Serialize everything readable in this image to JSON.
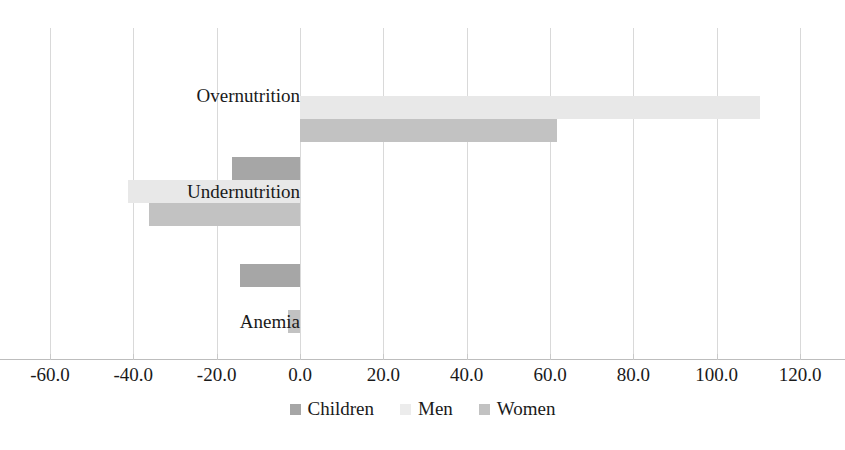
{
  "chart_data": {
    "type": "bar",
    "orientation": "horizontal",
    "title": "",
    "xlabel": "",
    "ylabel": "",
    "categories": [
      "Overnutrition",
      "Undernutrition",
      "Anemia"
    ],
    "series": [
      {
        "name": "Children",
        "color": "#a6a6a6",
        "values": [
          null,
          -16.3,
          -14.4
        ]
      },
      {
        "name": "Men",
        "color": "#ececec",
        "values": [
          110.5,
          -41.3,
          null
        ]
      },
      {
        "name": "Women",
        "color": "#c2c2c2",
        "values": [
          61.7,
          -36.2,
          -2.9
        ]
      }
    ],
    "xlim": [
      -60.0,
      120.0
    ],
    "xticks": [
      -60.0,
      -40.0,
      -20.0,
      0.0,
      20.0,
      40.0,
      60.0,
      80.0,
      100.0,
      120.0
    ],
    "xtick_labels": [
      "-60.0",
      "-40.0",
      "-20.0",
      "0.0",
      "20.0",
      "40.0",
      "60.0",
      "80.0",
      "100.0",
      "120.0"
    ],
    "grid": true,
    "grid_axis": "x",
    "legend": {
      "position": "bottom",
      "entries": [
        "Children",
        "Men",
        "Women"
      ]
    }
  },
  "axis": {
    "ticks": [
      {
        "value": -60.0,
        "label": "-60.0"
      },
      {
        "value": -40.0,
        "label": "-40.0"
      },
      {
        "value": -20.0,
        "label": "-20.0"
      },
      {
        "value": 0.0,
        "label": "0.0"
      },
      {
        "value": 20.0,
        "label": "20.0"
      },
      {
        "value": 40.0,
        "label": "40.0"
      },
      {
        "value": 60.0,
        "label": "60.0"
      },
      {
        "value": 80.0,
        "label": "80.0"
      },
      {
        "value": 100.0,
        "label": "100.0"
      },
      {
        "value": 120.0,
        "label": "120.0"
      }
    ]
  },
  "categories": [
    {
      "label": "Overnutrition"
    },
    {
      "label": "Undernutrition"
    },
    {
      "label": "Anemia"
    }
  ],
  "legend": {
    "items": [
      {
        "label": "Children",
        "key": "children"
      },
      {
        "label": "Men",
        "key": "men"
      },
      {
        "label": "Women",
        "key": "women"
      }
    ]
  }
}
